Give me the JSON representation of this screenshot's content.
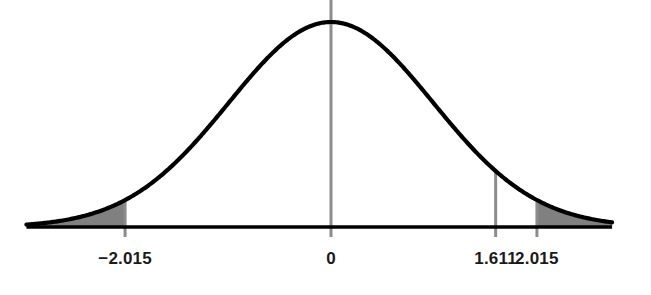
{
  "chart_data": {
    "type": "area",
    "title": "",
    "subtitle": "",
    "xlabel": "",
    "ylabel": "",
    "distribution": "normal",
    "mean": 0,
    "sigma": 1.0,
    "xlim": [
      -2.98,
      2.75
    ],
    "ylim": [
      0,
      1
    ],
    "grid": false,
    "legend": null,
    "curve_color": "#000000",
    "shade_color": "#808080",
    "axis_color": "#000000",
    "marker_line_color": "#8c8c8c",
    "background_color": "#ffffff",
    "axis_tick_values": [
      -2.015,
      0,
      1.611,
      2.015
    ],
    "axis_tick_labels": [
      "−2.015",
      "0",
      "1.611",
      "2.015"
    ],
    "marker_lines": [
      {
        "label": "−2.015",
        "value": -2.015
      },
      {
        "label": "0",
        "value": 0
      },
      {
        "label": "1.611",
        "value": 1.611
      },
      {
        "label": "2.015",
        "value": 2.015
      }
    ],
    "shaded_regions": [
      {
        "name": "left-tail",
        "from": -2.98,
        "to": -2.015
      },
      {
        "name": "right-tail",
        "from": 2.015,
        "to": 2.75
      }
    ],
    "annotations": []
  },
  "labels": {
    "left_critical": "−2.015",
    "center": "0",
    "test_statistic": "1.611",
    "right_critical": "2.015"
  }
}
